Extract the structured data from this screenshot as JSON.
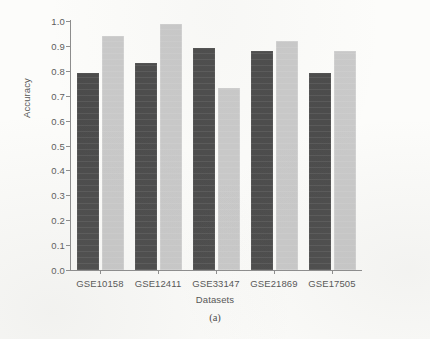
{
  "figure": {
    "caption": "(a)",
    "ylabel": "Accuracy",
    "xlabel": "Datasets"
  },
  "chart_data": {
    "type": "bar",
    "title": "",
    "subtitle": "",
    "xlabel": "Datasets",
    "ylabel": "Accuracy",
    "categories": [
      "GSE10158",
      "GSE12411",
      "GSE33147",
      "GSE21869",
      "GSE17505"
    ],
    "series": [
      {
        "name": "series-1",
        "color": "#4b4b4b",
        "values": [
          0.79,
          0.83,
          0.89,
          0.88,
          0.79
        ]
      },
      {
        "name": "series-2",
        "color": "#c9c9c9",
        "values": [
          0.94,
          0.99,
          0.73,
          0.92,
          0.88
        ]
      }
    ],
    "ylim": [
      0.0,
      1.0
    ],
    "ytick_labels": [
      "0.0",
      "0.1",
      "0.2",
      "0.3",
      "0.4",
      "0.5",
      "0.6",
      "0.7",
      "0.8",
      "0.9",
      "1.0"
    ],
    "ytick_values": [
      0.0,
      0.1,
      0.2,
      0.3,
      0.4,
      0.5,
      0.6,
      0.7,
      0.8,
      0.9,
      1.0
    ],
    "grid": false,
    "legend": "none",
    "annotations": [
      "(a)"
    ]
  },
  "colors": {
    "series_dark": "#4b4b4b",
    "series_light": "#c9c9c9",
    "axis": "#8d8d8d",
    "text": "#555555",
    "background": "#fcfcfa"
  }
}
